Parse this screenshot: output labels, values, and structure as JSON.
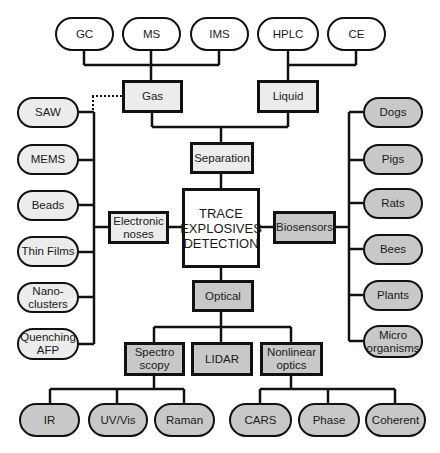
{
  "diagram": {
    "center": {
      "label": "TRACE EXPLOSIVES DETECTION"
    },
    "separation": {
      "label": "Separation",
      "gas": {
        "label": "Gas",
        "children": [
          "GC",
          "MS",
          "IMS"
        ]
      },
      "liquid": {
        "label": "Liquid",
        "children": [
          "HPLC",
          "CE"
        ]
      }
    },
    "electronic_noses": {
      "label": "Electronic noses",
      "children": [
        "SAW",
        "MEMS",
        "Beads",
        "Thin Films",
        "Nano- clusters",
        "Quenching AFP"
      ]
    },
    "biosensors": {
      "label": "Biosensors",
      "children": [
        "Dogs",
        "Pigs",
        "Rats",
        "Bees",
        "Plants",
        "Micro organisms"
      ]
    },
    "optical": {
      "label": "Optical",
      "spectroscopy": {
        "label": "Spectro scopy",
        "children": [
          "IR",
          "UV/Vis",
          "Raman"
        ]
      },
      "lidar": {
        "label": "LIDAR"
      },
      "nonlinear": {
        "label": "Nonlinear optics",
        "children": [
          "CARS",
          "Phase",
          "Coherent"
        ]
      }
    },
    "colors": {
      "line": "#111111",
      "fill_white": "#ffffff",
      "fill_light": "#ececec",
      "fill_gray": "#c8c8c8"
    }
  }
}
